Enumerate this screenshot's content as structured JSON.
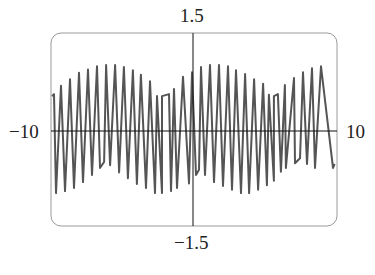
{
  "chart_data": {
    "type": "line",
    "title": "",
    "xlabel": "",
    "ylabel": "",
    "xlim": [
      -10,
      10
    ],
    "ylim": [
      -1.5,
      1.5
    ],
    "grid": false,
    "legend": null,
    "tick_labels": {
      "x_min": "−10",
      "x_max": "10",
      "y_max": "1.5",
      "y_min": "−1.5"
    },
    "frame": {
      "rounded_corners": true,
      "color": "#9a9a9a"
    },
    "line_color": "#555555",
    "axis_color": "#111111",
    "series": [
      {
        "name": "f(x)",
        "description": "Rapidly oscillating (aliased) sinusoid with slowly varying amplitude envelope between about 0.5 and 1.0",
        "points": [
          [
            -9.93,
            0.54
          ],
          [
            -9.65,
            -0.96
          ],
          [
            -9.79,
            0.57
          ],
          [
            -9.3,
            0.7
          ],
          [
            -9.02,
            -0.93
          ],
          [
            -8.67,
            0.8
          ],
          [
            -8.39,
            -0.88
          ],
          [
            -8.04,
            0.9
          ],
          [
            -7.76,
            -0.79
          ],
          [
            -7.41,
            0.95
          ],
          [
            -7.13,
            -0.68
          ],
          [
            -6.78,
            1.0
          ],
          [
            -6.57,
            -0.57
          ],
          [
            -6.15,
            1.02
          ],
          [
            -6.29,
            -0.48
          ],
          [
            -5.87,
            -0.53
          ],
          [
            -5.52,
            1.02
          ],
          [
            -5.24,
            -0.64
          ],
          [
            -4.9,
            0.99
          ],
          [
            -4.62,
            -0.73
          ],
          [
            -4.27,
            0.94
          ],
          [
            -3.99,
            -0.82
          ],
          [
            -3.71,
            0.87
          ],
          [
            -3.36,
            -0.88
          ],
          [
            -3.08,
            0.77
          ],
          [
            -2.73,
            -0.96
          ],
          [
            -2.59,
            0.54
          ],
          [
            -2.24,
            -0.96
          ],
          [
            -2.24,
            0.54
          ],
          [
            -1.75,
            0.57
          ],
          [
            -1.61,
            -0.93
          ],
          [
            -1.4,
            0.65
          ],
          [
            -1.19,
            -0.88
          ],
          [
            -0.77,
            0.84
          ],
          [
            -0.35,
            -0.81
          ],
          [
            -0.14,
            0.91
          ],
          [
            0.14,
            -0.68
          ],
          [
            0.49,
            0.99
          ],
          [
            0.35,
            -0.6
          ],
          [
            0.77,
            -0.68
          ],
          [
            1.12,
            1.02
          ],
          [
            1.4,
            -0.79
          ],
          [
            1.75,
            1.02
          ],
          [
            2.03,
            -0.85
          ],
          [
            2.38,
            1.0
          ],
          [
            2.66,
            -0.91
          ],
          [
            2.94,
            0.94
          ],
          [
            3.29,
            -0.96
          ],
          [
            3.57,
            0.88
          ],
          [
            3.85,
            -0.96
          ],
          [
            4.2,
            0.8
          ],
          [
            4.48,
            -0.91
          ],
          [
            4.83,
            0.73
          ],
          [
            5.1,
            -0.84
          ],
          [
            5.24,
            0.56
          ],
          [
            5.59,
            -0.77
          ],
          [
            5.59,
            0.54
          ],
          [
            5.87,
            0.57
          ],
          [
            6.08,
            -0.63
          ],
          [
            6.36,
            0.71
          ],
          [
            6.43,
            -0.57
          ],
          [
            6.99,
            0.82
          ],
          [
            7.06,
            -0.5
          ],
          [
            7.62,
            0.91
          ],
          [
            7.41,
            -0.42
          ],
          [
            7.9,
            -0.51
          ],
          [
            8.25,
            0.97
          ],
          [
            8.46,
            -0.57
          ],
          [
            8.88,
            1.0
          ],
          [
            9.72,
            -0.57
          ],
          [
            9.83,
            -0.51
          ]
        ]
      }
    ]
  }
}
